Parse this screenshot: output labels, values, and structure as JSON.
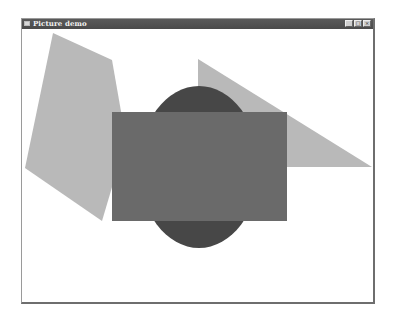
{
  "window": {
    "title": "Picture demo",
    "buttons": {
      "minimize": "_",
      "maximize": "□",
      "close": "×"
    }
  },
  "canvas": {
    "shapes": [
      {
        "type": "polygon",
        "name": "light-polygon",
        "color": "#b9b9b9"
      },
      {
        "type": "triangle",
        "name": "light-triangle",
        "color": "#b9b9b9"
      },
      {
        "type": "ellipse",
        "name": "dark-ellipse",
        "color": "#474747"
      },
      {
        "type": "rectangle",
        "name": "medium-rectangle",
        "color": "#6a6a6a"
      }
    ]
  }
}
